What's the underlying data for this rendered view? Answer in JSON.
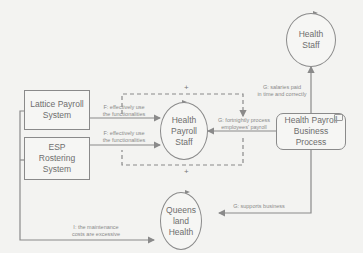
{
  "diagram": {
    "type": "causal-loop / business motivation diagram",
    "nodes": [
      {
        "id": "lattice",
        "shape": "rectangle",
        "label": "Lattice Payroll System"
      },
      {
        "id": "esp",
        "shape": "rectangle",
        "label": "ESP Rostering System"
      },
      {
        "id": "hps",
        "shape": "circle",
        "label": "Health Payroll Staff"
      },
      {
        "id": "hs",
        "shape": "circle",
        "label": "Health Staff"
      },
      {
        "id": "hpbp",
        "shape": "rounded-rectangle",
        "label": "Health Payroll Business Process",
        "icon": "business-process-icon"
      },
      {
        "id": "qh",
        "shape": "circle",
        "label": "Queens land Health"
      }
    ],
    "labels": {
      "lattice_line1": "Lattice Payroll",
      "lattice_line2": "System",
      "esp_line1": "ESP",
      "esp_line2": "Rostering",
      "esp_line3": "System",
      "hps_line1": "Health",
      "hps_line2": "Payroll",
      "hps_line3": "Staff",
      "hs_line1": "Health",
      "hs_line2": "Staff",
      "hpbp_line1": "Health Payroll",
      "hpbp_line2": "Business",
      "hpbp_line3": "Process",
      "qh_line1": "Queens",
      "qh_line2": "land",
      "qh_line3": "Health"
    },
    "edges": [
      {
        "from": "lattice",
        "to": "hps",
        "line1": "F: effectively use",
        "line2": "the functionalities"
      },
      {
        "from": "esp",
        "to": "hps",
        "line1": "F: effectively use",
        "line2": "the functionalities"
      },
      {
        "from": "hpbp",
        "to": "hps",
        "line1": "G: fortnightly process",
        "line2": "employees' payroll"
      },
      {
        "from": "hpbp",
        "to": "hs",
        "line1": "G: salaries paid",
        "line2": "in time and correctly"
      },
      {
        "from": "hpbp",
        "to": "qh",
        "line1": "G: supports business",
        "line2": ""
      },
      {
        "from": "lattice+esp",
        "to": "qh",
        "line1": "I: the maintenance",
        "line2": "costs are excessive"
      }
    ],
    "polarity_signs": {
      "top": "+",
      "bottom": "+"
    },
    "colors": {
      "background": "#f3f3f1",
      "stroke": "#8a8a8a",
      "text": "#6e6e6e"
    }
  }
}
